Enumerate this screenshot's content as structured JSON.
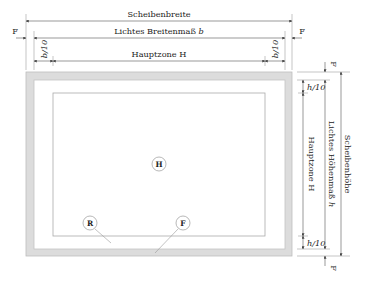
{
  "diagram": {
    "top_dimensions": {
      "overall_width": "Scheibenbreite",
      "clear_width_prefix": "Lichtes Breitenmaß",
      "clear_width_var": "b",
      "main_zone_width": "Hauptzone H",
      "left_margin": "b/10",
      "right_margin": "b/10",
      "left_frame": "F",
      "right_frame": "F"
    },
    "right_dimensions": {
      "overall_height": "Scheibenhöhe",
      "clear_height_prefix": "Lichtes Höhenmaß",
      "clear_height_var": "h",
      "main_zone_height": "Hauptzone H",
      "top_margin": "h/10",
      "bottom_margin": "h/10",
      "top_frame": "F",
      "bottom_frame": "F"
    },
    "zone_markers": {
      "main_zone": "H",
      "edge_zone": "R",
      "frame": "F"
    },
    "colors": {
      "frame_band": "#d9d9d9",
      "frame_edge": "#b5b5b5",
      "line": "#555555"
    }
  }
}
